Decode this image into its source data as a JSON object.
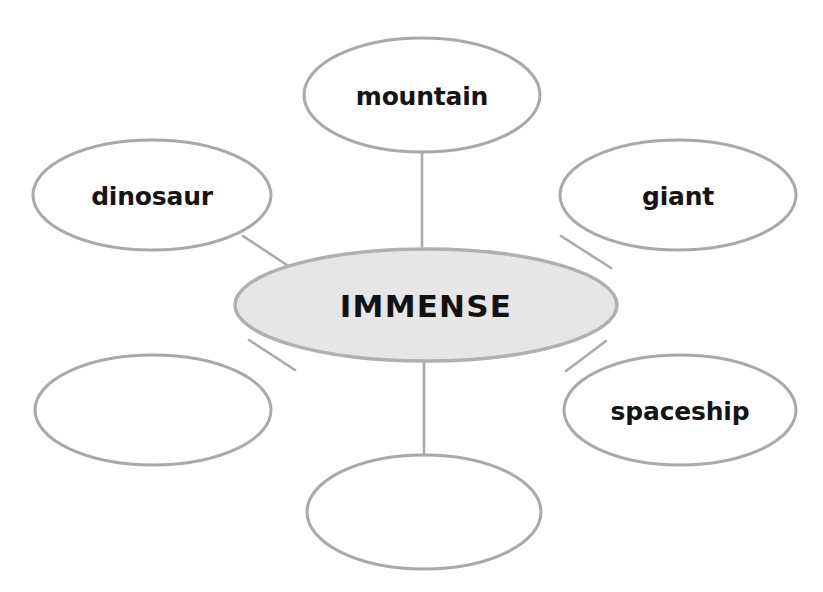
{
  "graphic_organizer": {
    "type": "word-web",
    "center": {
      "label": "IMMENSE",
      "fill_color": "#e6e6e6",
      "stroke_color": "#b0b0b0",
      "text_color": "#121212",
      "cx": 426,
      "cy": 305,
      "rx": 191,
      "ry": 56
    },
    "satellites": [
      {
        "id": "mountain",
        "label": "mountain",
        "filled": true,
        "cx": 422,
        "cy": 95,
        "rx": 118,
        "ry": 57
      },
      {
        "id": "dinosaur",
        "label": "dinosaur",
        "filled": true,
        "cx": 152,
        "cy": 195,
        "rx": 119,
        "ry": 55
      },
      {
        "id": "giant",
        "label": "giant",
        "filled": true,
        "cx": 678,
        "cy": 195,
        "rx": 118,
        "ry": 55
      },
      {
        "id": "spaceship",
        "label": "spaceship",
        "filled": true,
        "cx": 680,
        "cy": 410,
        "rx": 116,
        "ry": 55
      },
      {
        "id": "blank-lower-left",
        "label": "",
        "filled": false,
        "cx": 153,
        "cy": 410,
        "rx": 118,
        "ry": 55
      },
      {
        "id": "blank-bottom",
        "label": "",
        "filled": false,
        "cx": 424,
        "cy": 512,
        "rx": 117,
        "ry": 57
      }
    ],
    "connectors": [
      {
        "id": "center-to-mountain",
        "x1": 422,
        "y1": 152,
        "x2": 422,
        "y2": 250
      },
      {
        "id": "center-to-dinosaur",
        "x1": 243,
        "y1": 236,
        "x2": 296,
        "y2": 271
      },
      {
        "id": "center-to-giant",
        "x1": 611,
        "y1": 268,
        "x2": 561,
        "y2": 236
      },
      {
        "id": "center-to-spaceship",
        "x1": 606,
        "y1": 341,
        "x2": 566,
        "y2": 371
      },
      {
        "id": "center-to-blank-lower-left",
        "x1": 249,
        "y1": 340,
        "x2": 295,
        "y2": 370
      },
      {
        "id": "center-to-blank-bottom",
        "x1": 424,
        "y1": 361,
        "x2": 424,
        "y2": 455
      }
    ],
    "colors": {
      "page_background": "#ffffff",
      "node_stroke": "#a9a9a9",
      "center_fill": "#e6e6e6",
      "connector": "#ababab",
      "label_text": "#151515"
    }
  }
}
